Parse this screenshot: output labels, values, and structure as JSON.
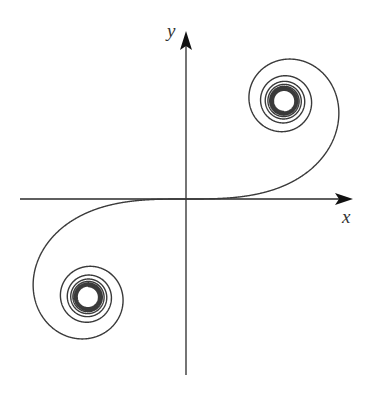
{
  "diagram": {
    "x_label": "x",
    "y_label": "y",
    "stroke_color": "#3a3a3a",
    "axis_color": "#2a2a2a"
  },
  "chart_data": {
    "type": "line",
    "title": "",
    "xlabel": "x",
    "ylabel": "y",
    "curve": "clothoid x=∫cos(πt²/2)dt, y=∫sin(πt²/2)dt",
    "t_range": [
      -6,
      6
    ],
    "asymptotic_points": [
      [
        0.5,
        0.5
      ],
      [
        -0.5,
        -0.5
      ]
    ],
    "grid": false,
    "legend": false
  }
}
